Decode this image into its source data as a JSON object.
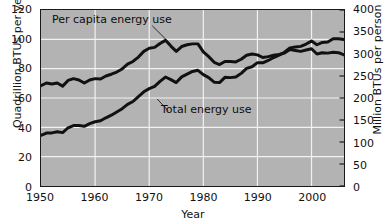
{
  "chart_data": {
    "type": "line",
    "title": "",
    "xlabel": "Year",
    "ylabel": "Quadrillion BTUs per year",
    "ylabel_right": "Million BTUs per person per year",
    "xlim": [
      1950,
      2006
    ],
    "ylim": [
      0,
      120
    ],
    "ylim_right": [
      0,
      400
    ],
    "grid": true,
    "legend": "inline-annotations",
    "xticks": [
      "1950",
      "1960",
      "1970",
      "1980",
      "1990",
      "2000"
    ],
    "xtick_values": [
      1950,
      1960,
      1970,
      1980,
      1990,
      2000
    ],
    "yticks_left": [
      "0",
      "20",
      "40",
      "60",
      "80",
      "100",
      "120"
    ],
    "ytick_values_left": [
      0,
      20,
      40,
      60,
      80,
      100,
      120
    ],
    "yticks_right": [
      "0",
      "50",
      "100",
      "150",
      "200",
      "250",
      "300",
      "350",
      "400"
    ],
    "ytick_values_right": [
      0,
      50,
      100,
      150,
      200,
      250,
      300,
      350,
      400
    ],
    "plot_bgcolor": "#b3b3b3",
    "gridline_color": "#f2f2f2",
    "line_color": "#111111",
    "series": [
      {
        "name": "Per capita energy use",
        "axis": "right",
        "units": "Million BTUs per person per year",
        "x": [
          1950,
          1951,
          1952,
          1953,
          1954,
          1955,
          1956,
          1957,
          1958,
          1959,
          1960,
          1961,
          1962,
          1963,
          1964,
          1965,
          1966,
          1967,
          1968,
          1969,
          1970,
          1971,
          1972,
          1973,
          1974,
          1975,
          1976,
          1977,
          1978,
          1979,
          1980,
          1981,
          1982,
          1983,
          1984,
          1985,
          1986,
          1987,
          1988,
          1989,
          1990,
          1991,
          1992,
          1993,
          1994,
          1995,
          1996,
          1997,
          1998,
          1999,
          2000,
          2001,
          2002,
          2003,
          2004,
          2005,
          2006
        ],
        "values": [
          228,
          234,
          232,
          234,
          227,
          240,
          244,
          241,
          234,
          241,
          244,
          243,
          250,
          254,
          259,
          266,
          277,
          283,
          293,
          306,
          313,
          315,
          324,
          331,
          318,
          306,
          317,
          321,
          323,
          323,
          305,
          294,
          281,
          276,
          283,
          283,
          282,
          288,
          297,
          300,
          298,
          292,
          294,
          297,
          299,
          302,
          310,
          308,
          306,
          309,
          312,
          300,
          303,
          302,
          304,
          303,
          298
        ]
      },
      {
        "name": "Total energy use",
        "axis": "left",
        "units": "Quadrillion BTUs per year",
        "x": [
          1950,
          1951,
          1952,
          1953,
          1954,
          1955,
          1956,
          1957,
          1958,
          1959,
          1960,
          1961,
          1962,
          1963,
          1964,
          1965,
          1966,
          1967,
          1968,
          1969,
          1970,
          1971,
          1972,
          1973,
          1974,
          1975,
          1976,
          1977,
          1978,
          1979,
          1980,
          1981,
          1982,
          1983,
          1984,
          1985,
          1986,
          1987,
          1988,
          1989,
          1990,
          1991,
          1992,
          1993,
          1994,
          1995,
          1996,
          1997,
          1998,
          1999,
          2000,
          2001,
          2002,
          2003,
          2004,
          2005,
          2006
        ],
        "values": [
          34.6,
          36.1,
          36.2,
          37.0,
          36.4,
          39.7,
          41.2,
          41.3,
          40.7,
          42.5,
          43.8,
          44.5,
          46.5,
          48.3,
          50.5,
          52.7,
          55.7,
          57.6,
          61.0,
          64.2,
          66.4,
          67.9,
          71.3,
          74.3,
          72.5,
          70.5,
          74.4,
          76.3,
          78.1,
          78.9,
          75.9,
          73.9,
          70.8,
          70.5,
          74.1,
          73.9,
          74.3,
          76.8,
          80.2,
          81.3,
          84.1,
          84.0,
          85.6,
          87.6,
          89.2,
          91.2,
          94.2,
          94.8,
          95.2,
          96.8,
          98.8,
          96.3,
          97.9,
          98.2,
          100.4,
          100.4,
          99.8
        ]
      }
    ],
    "annotations": [
      {
        "text": "Per capita energy use",
        "x": 1951.5,
        "y": 112
      },
      {
        "text": "Total energy use",
        "x": 1972,
        "y": 52
      }
    ]
  },
  "axes": {
    "x_title": "Year",
    "y_left_title": "Quadrillion BTUs per year",
    "y_right_title": "Million BTUs per person per year"
  },
  "annotations": {
    "per_capita": "Per capita energy use",
    "total": "Total energy use"
  }
}
